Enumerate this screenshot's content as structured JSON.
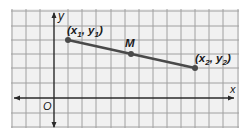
{
  "diagram": {
    "axes": {
      "x_label": "x",
      "y_label": "y",
      "origin_label": "O"
    },
    "points": {
      "p1": {
        "label_main": "(x",
        "sub1": "1",
        "mid": ", y",
        "sub2": "1",
        "end": ")"
      },
      "midpoint": {
        "label": "M"
      },
      "p2": {
        "label_main": "(x",
        "sub1": "2",
        "mid": ", y",
        "sub2": "2",
        "end": ")"
      }
    },
    "colors": {
      "grid_background": "#f0f0f0",
      "grid_line": "#9a9a9a",
      "axis": "#2a2a2a",
      "segment": "#4a4a4a",
      "point": "#4a4a4a"
    }
  }
}
